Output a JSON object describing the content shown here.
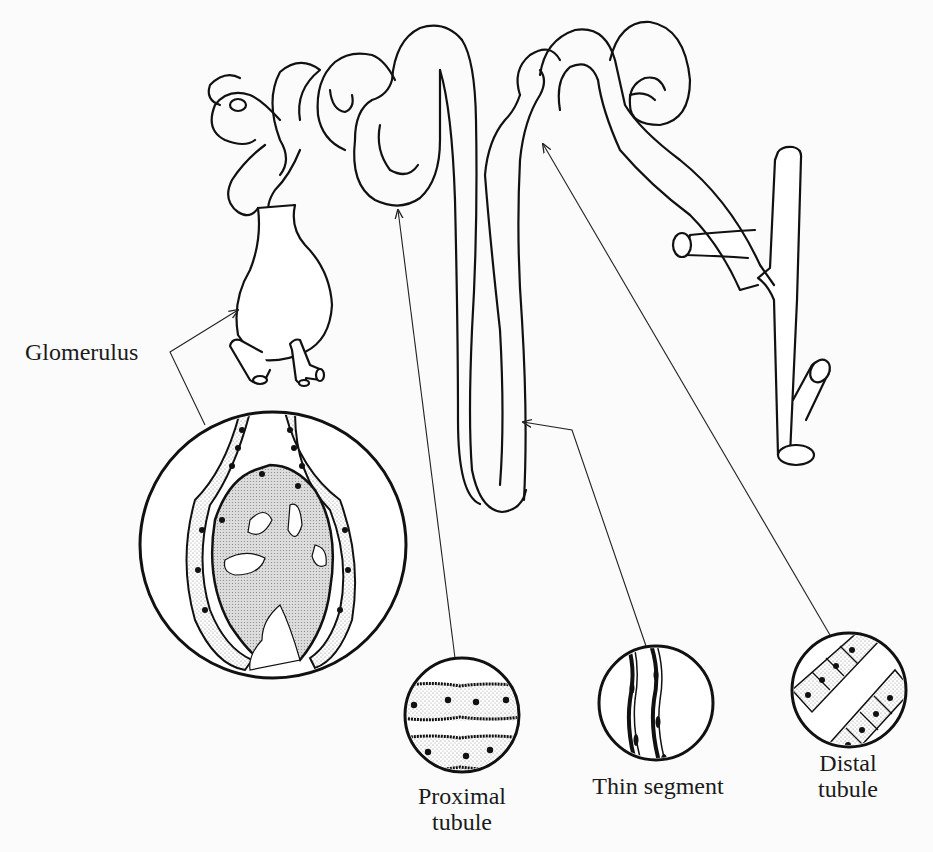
{
  "figure": {
    "background": "#fbfbfb",
    "ink": "#111111"
  },
  "labels": {
    "glomerulus": "Glomerulus",
    "proximal_tubule_line1": "Proximal",
    "proximal_tubule_line2": "tubule",
    "thin_segment": "Thin segment",
    "distal_tubule_line1": "Distal",
    "distal_tubule_line2": "tubule"
  },
  "insets": [
    {
      "name": "Glomerulus",
      "shape": "circle",
      "cx": 273,
      "cy": 545,
      "r": 133
    },
    {
      "name": "Proximal tubule",
      "shape": "circle",
      "cx": 462,
      "cy": 715,
      "r": 57
    },
    {
      "name": "Thin segment",
      "shape": "circle",
      "cx": 656,
      "cy": 703,
      "r": 57
    },
    {
      "name": "Distal tubule",
      "shape": "circle",
      "cx": 849,
      "cy": 690,
      "r": 57
    }
  ]
}
